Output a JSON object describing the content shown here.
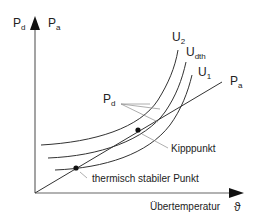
{
  "diagram": {
    "y_axis": {
      "label_left": "P",
      "label_left_sub": "d",
      "label_right": "P",
      "label_right_sub": "a"
    },
    "x_axis": {
      "label": "Übertemperatur",
      "symbol": "ϑ"
    },
    "curves": [
      {
        "name": "U",
        "sub": "2"
      },
      {
        "name": "U",
        "sub": "dth"
      },
      {
        "name": "U",
        "sub": "1"
      }
    ],
    "line_label": {
      "name": "P",
      "sub": "a"
    },
    "pd_label": {
      "name": "P",
      "sub": "d"
    },
    "points": {
      "kipp": "Kipppunkt",
      "stable": "thermisch stabiler Punkt"
    },
    "colors": {
      "line": "#333333",
      "leader": "#999999",
      "text": "#222222"
    }
  }
}
